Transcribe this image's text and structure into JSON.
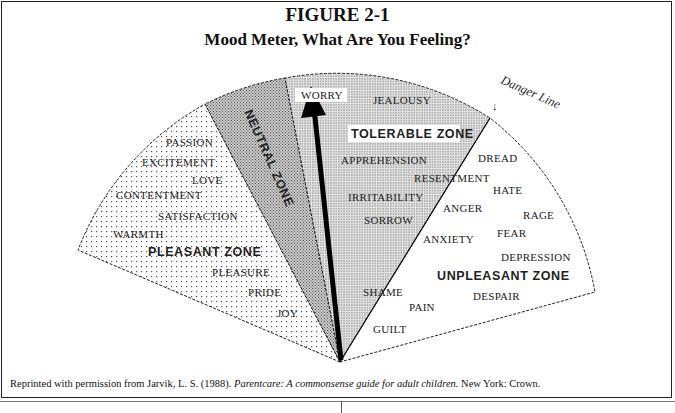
{
  "figure": {
    "number": "FIGURE 2-1",
    "title": "Mood Meter, What Are You Feeling?"
  },
  "diagram": {
    "type": "semicircular mood meter",
    "pointer": "arrow pointing up toward WORRY",
    "danger_line_label": "Danger Line",
    "danger_line_arrow": "↓",
    "zones": [
      {
        "name": "PLEASANT ZONE",
        "pattern": "sparse dots",
        "emotions": [
          "PASSION",
          "EXCITEMENT",
          "LOVE",
          "CONTENTMENT",
          "SATISFACTION",
          "WARMTH",
          "PLEASURE",
          "PRIDE",
          "JOY"
        ]
      },
      {
        "name": "NEUTRAL ZONE",
        "pattern": "crosshatch",
        "emotions": []
      },
      {
        "name": "TOLERABLE ZONE",
        "pattern": "dense dots",
        "emotions": [
          "WORRY",
          "JEALOUSY",
          "APPREHENSION",
          "IRRITABILITY",
          "SORROW",
          "SHAME"
        ]
      },
      {
        "name": "UNPLEASANT ZONE",
        "pattern": "white",
        "emotions": [
          "DREAD",
          "RESENTMENT",
          "HATE",
          "ANGER",
          "RAGE",
          "ANXIETY",
          "FEAR",
          "DEPRESSION",
          "DESPAIR",
          "PAIN",
          "GUILT"
        ]
      }
    ]
  },
  "labels": {
    "pleasant_zone": "PLEASANT ZONE",
    "neutral_zone": "NEUTRAL ZONE",
    "tolerable_zone": "TOLERABLE ZONE",
    "unpleasant_zone": "UNPLEASANT ZONE",
    "danger_line": "Danger Line",
    "danger_arrow": "↓",
    "passion": "PASSION",
    "excitement": "EXCITEMENT",
    "love": "LOVE",
    "contentment": "CONTENTMENT",
    "satisfaction": "SATISFACTION",
    "warmth": "WARMTH",
    "pleasure": "PLEASURE",
    "pride": "PRIDE",
    "joy": "JOY",
    "worry": "WORRY",
    "jealousy": "JEALOUSY",
    "apprehension": "APPREHENSION",
    "irritability": "IRRITABILITY",
    "sorrow": "SORROW",
    "shame": "SHAME",
    "dread": "DREAD",
    "resentment": "RESENTMENT",
    "hate": "HATE",
    "anger": "ANGER",
    "rage": "RAGE",
    "anxiety": "ANXIETY",
    "fear": "FEAR",
    "depression": "DEPRESSION",
    "despair": "DESPAIR",
    "pain": "PAIN",
    "guilt": "GUILT"
  },
  "caption": {
    "prefix": "Reprinted with permission from Jarvik, L. S. (1988). ",
    "title": "Parentcare: A commonsense guide for adult children.",
    "suffix": " New York: Crown."
  }
}
